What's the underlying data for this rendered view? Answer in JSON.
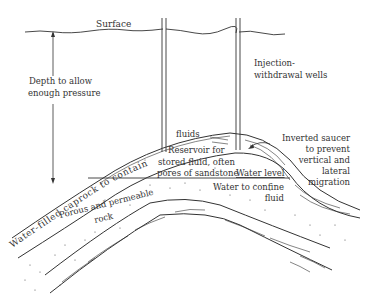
{
  "diagram": {
    "type": "underground gas/fluid storage cross-section",
    "labels": {
      "surface": "Surface",
      "depth_line1": "Depth to allow",
      "depth_line2": "enough pressure",
      "wells_line1": "Injection-",
      "wells_line2": "withdrawal wells",
      "caprock": "Water-filled caprock to contain",
      "fluids": "fluids",
      "reservoir_line1": "Reservoir for",
      "reservoir_line2": "stored fluid, often",
      "reservoir_line3": "pores of sandstone",
      "saucer_line1": "Inverted saucer",
      "saucer_line2": "to prevent",
      "saucer_line3": "vertical and",
      "saucer_line4": "lateral",
      "saucer_line5": "migration",
      "water_level": "Water level",
      "water_confine_line1": "Water to confine",
      "water_confine_line2": "fluid",
      "porous_line1": "Porous and permeable",
      "porous_line2": "rock"
    },
    "colors": {
      "line": "#333333",
      "background": "#ffffff"
    }
  }
}
